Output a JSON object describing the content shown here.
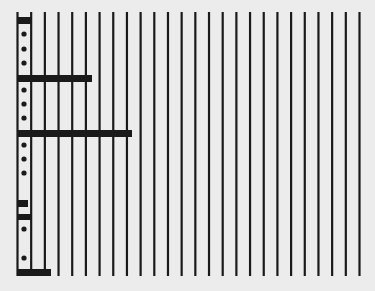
{
  "diagram": {
    "background": "#ececec",
    "ink": "#1a1a1a",
    "lines": {
      "count": 26,
      "x_start": 17.5,
      "spacing": 13.68,
      "y_top": 12,
      "y_bottom": 276,
      "width": 2.2
    },
    "bars": [
      {
        "y": 17,
        "h": 7,
        "x_start": 17,
        "x_end": 31
      },
      {
        "y": 75,
        "h": 7,
        "x_start": 17,
        "x_end": 92
      },
      {
        "y": 130,
        "h": 7,
        "x_start": 17,
        "x_end": 132
      },
      {
        "y": 200,
        "h": 7,
        "x_start": 17,
        "x_end": 28
      },
      {
        "y": 214,
        "h": 6,
        "x_start": 17,
        "x_end": 31
      },
      {
        "y": 269,
        "h": 7,
        "x_start": 17,
        "x_end": 51
      }
    ],
    "dots": [
      {
        "x": 24,
        "y": 34
      },
      {
        "x": 24,
        "y": 49
      },
      {
        "x": 24,
        "y": 63
      },
      {
        "x": 24,
        "y": 90
      },
      {
        "x": 24,
        "y": 104
      },
      {
        "x": 24,
        "y": 118
      },
      {
        "x": 24,
        "y": 145
      },
      {
        "x": 24,
        "y": 159
      },
      {
        "x": 24,
        "y": 173
      },
      {
        "x": 24,
        "y": 229
      },
      {
        "x": 24,
        "y": 258
      }
    ],
    "dot_radius": 2.6
  }
}
